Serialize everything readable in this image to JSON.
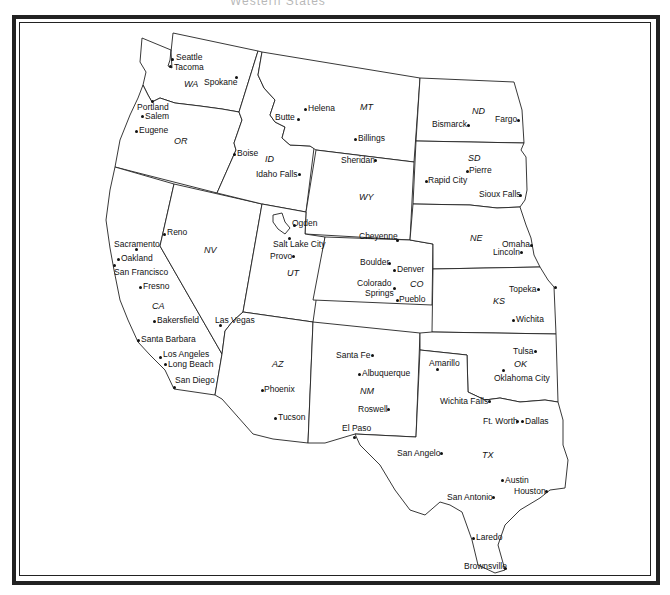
{
  "map": {
    "title": "Western States",
    "states": [
      {
        "abbr": "WA",
        "x": 184,
        "y": 84
      },
      {
        "abbr": "OR",
        "x": 174,
        "y": 141
      },
      {
        "abbr": "ID",
        "x": 265,
        "y": 159
      },
      {
        "abbr": "MT",
        "x": 363,
        "y": 107
      },
      {
        "abbr": "ND",
        "x": 473,
        "y": 111
      },
      {
        "abbr": "SD",
        "x": 469,
        "y": 158
      },
      {
        "abbr": "WY",
        "x": 360,
        "y": 197
      },
      {
        "abbr": "NV",
        "x": 204,
        "y": 250
      },
      {
        "abbr": "UT",
        "x": 287,
        "y": 273
      },
      {
        "abbr": "CO",
        "x": 410,
        "y": 284
      },
      {
        "abbr": "NE",
        "x": 470,
        "y": 238
      },
      {
        "abbr": "KS",
        "x": 493,
        "y": 301
      },
      {
        "abbr": "CA",
        "x": 152,
        "y": 306
      },
      {
        "abbr": "AZ",
        "x": 273,
        "y": 364
      },
      {
        "abbr": "NM",
        "x": 360,
        "y": 391
      },
      {
        "abbr": "OK",
        "x": 515,
        "y": 364
      },
      {
        "abbr": "TX",
        "x": 482,
        "y": 455
      }
    ],
    "cities": [
      {
        "name": "Seattle",
        "dx": 172,
        "dy": 59,
        "lx": 176,
        "ly": 53
      },
      {
        "name": "Tacoma",
        "dx": 170,
        "dy": 66,
        "lx": 174,
        "ly": 63
      },
      {
        "name": "Spokane",
        "dx": 236,
        "dy": 77,
        "lx": 205,
        "ly": 78
      },
      {
        "name": "Portland",
        "dx": 152,
        "dy": 101,
        "lx": 137,
        "ly": 103
      },
      {
        "name": "Salem",
        "dx": 142,
        "dy": 116,
        "lx": 146,
        "ly": 113
      },
      {
        "name": "Eugene",
        "dx": 136,
        "dy": 131,
        "lx": 139,
        "ly": 126
      },
      {
        "name": "Boise",
        "dx": 234,
        "dy": 154,
        "lx": 237,
        "ly": 149
      },
      {
        "name": "Helena",
        "dx": 305,
        "dy": 109,
        "lx": 309,
        "ly": 104
      },
      {
        "name": "Butte",
        "dx": 298,
        "dy": 118,
        "lx": 276,
        "ly": 114
      },
      {
        "name": "Billings",
        "dx": 355,
        "dy": 139,
        "lx": 359,
        "ly": 134
      },
      {
        "name": "Bismarck",
        "dx": 467,
        "dy": 125,
        "lx": 432,
        "ly": 121
      },
      {
        "name": "Fargo",
        "dx": 518,
        "dy": 120,
        "lx": 495,
        "ly": 115
      },
      {
        "name": "Pierre",
        "dx": 466,
        "dy": 171,
        "lx": 469,
        "ly": 166
      },
      {
        "name": "Rapid City",
        "dx": 425,
        "dy": 181,
        "lx": 428,
        "ly": 176
      },
      {
        "name": "Sioux Falls",
        "dx": 519,
        "dy": 195,
        "lx": 479,
        "ly": 190
      },
      {
        "name": "Sheridan",
        "dx": 375,
        "dy": 160,
        "lx": 341,
        "ly": 156
      },
      {
        "name": "Idaho Falls",
        "dx": 298,
        "dy": 174,
        "lx": 256,
        "ly": 170
      },
      {
        "name": "Ogden",
        "dx": 294,
        "dy": 224,
        "lx": 292,
        "ly": 219
      },
      {
        "name": "Salt Lake City",
        "dx": 289,
        "dy": 237,
        "lx": 273,
        "ly": 240
      },
      {
        "name": "Provo",
        "dx": 292,
        "dy": 256,
        "lx": 270,
        "ly": 252
      },
      {
        "name": "Cheyenne",
        "dx": 396,
        "dy": 240,
        "lx": 359,
        "ly": 232
      },
      {
        "name": "Reno",
        "dx": 164,
        "dy": 233,
        "lx": 167,
        "ly": 228
      },
      {
        "name": "Sacramento",
        "dx": 136,
        "dy": 249,
        "lx": 114,
        "ly": 240
      },
      {
        "name": "Oakland",
        "dx": 117,
        "dy": 259,
        "lx": 121,
        "ly": 254
      },
      {
        "name": "San Francisco",
        "dx": 114,
        "dy": 265,
        "lx": 114,
        "ly": 268
      },
      {
        "name": "Fresno",
        "dx": 140,
        "dy": 287,
        "lx": 144,
        "ly": 282
      },
      {
        "name": "Bakersfield",
        "dx": 154,
        "dy": 320,
        "lx": 157,
        "ly": 316
      },
      {
        "name": "Las Vegas",
        "dx": 220,
        "dy": 325,
        "lx": 215,
        "ly": 316
      },
      {
        "name": "Santa Barbara",
        "dx": 138,
        "dy": 339,
        "lx": 141,
        "ly": 335
      },
      {
        "name": "Los Angeles",
        "dx": 160,
        "dy": 357,
        "lx": 163,
        "ly": 350
      },
      {
        "name": "Long Beach",
        "dx": 165,
        "dy": 364,
        "lx": 168,
        "ly": 360
      },
      {
        "name": "San Diego",
        "dx": 174,
        "dy": 386,
        "lx": 175,
        "ly": 376
      },
      {
        "name": "Phoenix",
        "dx": 261,
        "dy": 390,
        "lx": 264,
        "ly": 385
      },
      {
        "name": "Tucson",
        "dx": 274,
        "dy": 418,
        "lx": 278,
        "ly": 413
      },
      {
        "name": "Boulder",
        "dx": 389,
        "dy": 263,
        "lx": 360,
        "ly": 258
      },
      {
        "name": "Denver",
        "dx": 393,
        "dy": 270,
        "lx": 397,
        "ly": 265
      },
      {
        "name": "Colorado",
        "dx": 393,
        "dy": 288,
        "lx": 358,
        "ly": 279
      },
      {
        "name": "Springs",
        "dx": 0,
        "dy": 0,
        "lx": 365,
        "ly": 289
      },
      {
        "name": "Pueblo",
        "dx": 396,
        "dy": 300,
        "lx": 399,
        "ly": 295
      },
      {
        "name": "Omaha",
        "dx": 531,
        "dy": 245,
        "lx": 502,
        "ly": 240
      },
      {
        "name": "Lincoln",
        "dx": 521,
        "dy": 252,
        "lx": 494,
        "ly": 248
      },
      {
        "name": "Topeka",
        "dx": 537,
        "dy": 289,
        "lx": 510,
        "ly": 285
      },
      {
        "name": "Wichita",
        "dx": 512,
        "dy": 319,
        "lx": 516,
        "ly": 315
      },
      {
        "name": "Santa Fe",
        "dx": 372,
        "dy": 355,
        "lx": 336,
        "ly": 351
      },
      {
        "name": "Albuquerque",
        "dx": 359,
        "dy": 374,
        "lx": 362,
        "ly": 369
      },
      {
        "name": "Roswell",
        "dx": 388,
        "dy": 409,
        "lx": 358,
        "ly": 405
      },
      {
        "name": "El Paso",
        "dx": 354,
        "dy": 437,
        "lx": 342,
        "ly": 424
      },
      {
        "name": "Amarillo",
        "dx": 437,
        "dy": 369,
        "lx": 429,
        "ly": 359
      },
      {
        "name": "Tulsa",
        "dx": 535,
        "dy": 351,
        "lx": 513,
        "ly": 347
      },
      {
        "name": "Oklahoma City",
        "dx": 503,
        "dy": 370,
        "lx": 494,
        "ly": 374
      },
      {
        "name": "Wichita Falls",
        "dx": 488,
        "dy": 401,
        "lx": 440,
        "ly": 397
      },
      {
        "name": "Ft. Worth",
        "dx": 517,
        "dy": 421,
        "lx": 483,
        "ly": 417
      },
      {
        "name": "Dallas",
        "dx": 522,
        "dy": 421,
        "lx": 525,
        "ly": 417
      },
      {
        "name": "San Angelo",
        "dx": 441,
        "dy": 453,
        "lx": 398,
        "ly": 449
      },
      {
        "name": "Austin",
        "dx": 502,
        "dy": 480,
        "lx": 505,
        "ly": 476
      },
      {
        "name": "San Antonio",
        "dx": 493,
        "dy": 497,
        "lx": 448,
        "ly": 493
      },
      {
        "name": "Houston",
        "dx": 546,
        "dy": 491,
        "lx": 515,
        "ly": 487
      },
      {
        "name": "Laredo",
        "dx": 473,
        "dy": 537,
        "lx": 476,
        "ly": 533
      },
      {
        "name": "Brownsville",
        "dx": 505,
        "dy": 568,
        "lx": 464,
        "ly": 563
      }
    ]
  }
}
